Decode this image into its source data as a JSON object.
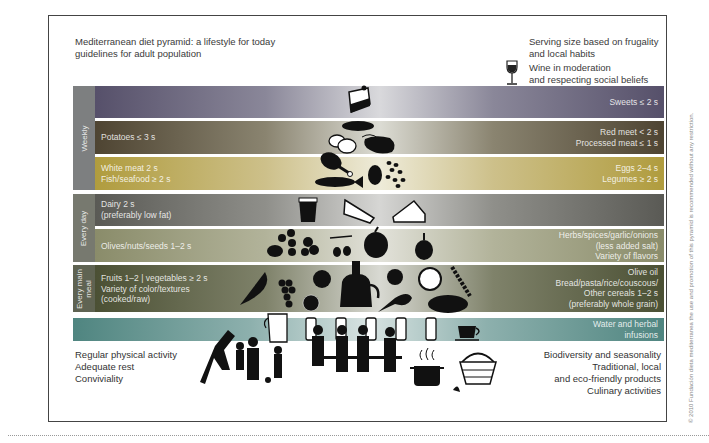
{
  "header": {
    "title_line1": "Mediterranean diet pyramid: a lifestyle for today",
    "title_line2": "guidelines for adult population",
    "serving_line1": "Serving size based on frugality",
    "serving_line2": "and local habits",
    "wine_line1": "Wine in moderation",
    "wine_line2": "and respecting social beliefs",
    "wine_icon": "wine-glass-icon"
  },
  "frequency_labels": {
    "weekly": "Weekly",
    "every_day": "Every day",
    "every_main_meal_1": "Every main",
    "every_main_meal_2": "meal"
  },
  "tiers": {
    "sweets": {
      "right": "Sweets ≤ 2 s",
      "icons": [
        "cake-icon"
      ]
    },
    "meat": {
      "left": "Potatoes ≤ 3 s",
      "right1": "Red meet < 2 s",
      "right2": "Processed meat ≤ 1 s",
      "icons": [
        "sausage-icon",
        "potatoes-icon",
        "steak-icon"
      ]
    },
    "white_meat": {
      "left1": "White meat 2 s",
      "left2": "Fish/seafood ≥ 2 s",
      "right1": "Eggs 2–4 s",
      "right2": "Legumes ≥ 2 s",
      "icons": [
        "chicken-leg-icon",
        "fish-icon",
        "egg-icon",
        "beans-icon"
      ]
    },
    "dairy": {
      "left1": "Dairy 2 s",
      "left2": "(preferably low fat)",
      "icons": [
        "yogurt-icon",
        "cheese-icon",
        "cheese-wedge-icon"
      ]
    },
    "olives": {
      "left": "Olives/nuts/seeds 1–2 s",
      "right1": "Herbs/spices/garlic/onions",
      "right2": "(less added salt)",
      "right3": "Variety of flavors",
      "icons": [
        "nuts-icon",
        "herbs-icon",
        "olives-icon",
        "onion-icon",
        "garlic-icon"
      ]
    },
    "fruits": {
      "left1": "Fruits 1–2 | vegetables ≥ 2 s",
      "left2": "Variety of color/textures",
      "left3": "(cooked/raw)",
      "right1": "Olive oil",
      "right2": "Bread/pasta/rice/couscous/",
      "right3": "Other cereals 1–2 s",
      "right4": "(preferably whole grain)",
      "icons": [
        "watermelon-icon",
        "grapes-icon",
        "apple-icon",
        "orange-icon",
        "olive-oil-jug-icon",
        "artichoke-icon",
        "chard-icon",
        "cabbage-icon",
        "wheat-icon",
        "bread-icon"
      ]
    },
    "water": {
      "right1": "Water and herbal",
      "right2": "infusions",
      "icons": [
        "jug-icon",
        "glass-icon",
        "glass-icon",
        "glass-icon",
        "glass-icon",
        "glass-icon",
        "teacup-icon"
      ]
    }
  },
  "lifestyle": {
    "left": [
      "Regular physical activity",
      "Adequate rest",
      "Conviviality"
    ],
    "right": [
      "Biodiversity and seasonality",
      "Traditional, local",
      "and eco-friendly products",
      "Culinary activities"
    ],
    "icons": [
      "family-activity-icon",
      "people-dining-icon",
      "cooking-pot-icon",
      "basket-icon"
    ]
  },
  "colors": {
    "sweets": "#56506a",
    "meat": "#4e4432",
    "white_meat": "#b09c3e",
    "dairy": "#5a5a55",
    "olives": "#8a8c6a",
    "fruits": "#4b5034",
    "water": "#4f8580"
  },
  "copyright": "© 2010 Fundación dieta mediterranea the use and promotion of this pyramid is recommended without any restriction."
}
